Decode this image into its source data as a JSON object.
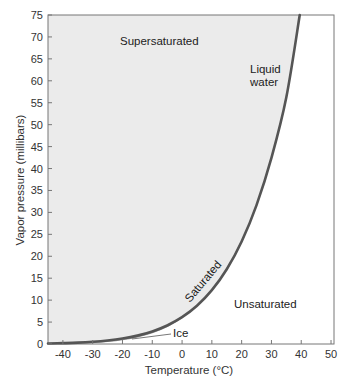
{
  "chart_data": {
    "type": "line",
    "title": "",
    "xlabel": "Temperature (°C)",
    "ylabel": "Vapor pressure (millibars)",
    "xlim": [
      -45,
      51
    ],
    "ylim": [
      0,
      75
    ],
    "x_ticks": [
      -40,
      -30,
      -20,
      -10,
      0,
      10,
      20,
      30,
      40,
      50
    ],
    "y_ticks": [
      0,
      5,
      10,
      15,
      20,
      25,
      30,
      35,
      40,
      45,
      50,
      55,
      60,
      65,
      70,
      75
    ],
    "grid": false,
    "series": [
      {
        "name": "Saturation vapor pressure over liquid water",
        "x": [
          -45,
          -40,
          -35,
          -30,
          -25,
          -20,
          -15,
          -10,
          -5,
          0,
          5,
          10,
          15,
          20,
          25,
          30,
          35,
          39.5
        ],
        "y": [
          0.1,
          0.19,
          0.31,
          0.51,
          0.81,
          1.25,
          1.91,
          2.86,
          4.22,
          6.11,
          8.72,
          12.27,
          17.04,
          23.37,
          31.67,
          42.43,
          56.24,
          75
        ]
      },
      {
        "name": "Saturation vapor pressure over ice",
        "x": [
          -45,
          -40,
          -35,
          -30,
          -25,
          -20,
          -15,
          -10,
          -5,
          0
        ],
        "y": [
          0.07,
          0.13,
          0.22,
          0.38,
          0.63,
          1.03,
          1.65,
          2.6,
          4.02,
          6.11
        ]
      }
    ],
    "annotations": [
      {
        "text": "Supersaturated",
        "x": -10,
        "y": 68.5,
        "region": "above curve (shaded)"
      },
      {
        "text": "Liquid water",
        "x": 27,
        "y": 64,
        "label_for": "water curve"
      },
      {
        "text": "Saturated",
        "x": 5,
        "y": 11,
        "rotated": true,
        "along": "curve"
      },
      {
        "text": "Unsaturated",
        "x": 32,
        "y": 8
      },
      {
        "text": "Ice",
        "x": -5,
        "y": 2.2,
        "label_for": "ice curve"
      }
    ],
    "colors": {
      "curve": "#555555",
      "supersaturated_fill": "#ebebeb",
      "axis": "#777777"
    }
  },
  "labels": {
    "supersaturated": "Supersaturated",
    "liquid_line1": "Liquid",
    "liquid_line2": "water",
    "saturated": "Saturated",
    "unsaturated": "Unsaturated",
    "ice": "Ice",
    "xlabel": "Temperature (°C)",
    "ylabel": "Vapor pressure (millibars)"
  }
}
